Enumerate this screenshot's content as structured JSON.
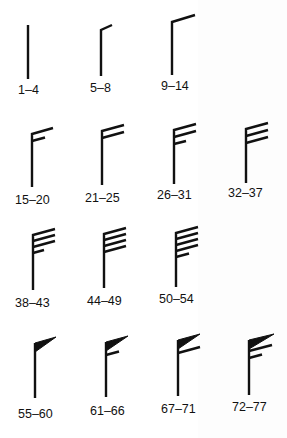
{
  "diagram": {
    "title_fragment": "",
    "units_note": "",
    "colors": {
      "ink": "#111111",
      "background": "#ffffff"
    },
    "barbs": [
      {
        "label": "1–4",
        "row": 1,
        "col": 1,
        "pennants": 0,
        "full_barbs": 0,
        "half_barbs": 0
      },
      {
        "label": "5–8",
        "row": 1,
        "col": 2,
        "pennants": 0,
        "full_barbs": 0,
        "half_barbs": 1
      },
      {
        "label": "9–14",
        "row": 1,
        "col": 3,
        "pennants": 0,
        "full_barbs": 1,
        "half_barbs": 0
      },
      {
        "label": "15–20",
        "row": 2,
        "col": 1,
        "pennants": 0,
        "full_barbs": 1,
        "half_barbs": 1
      },
      {
        "label": "21–25",
        "row": 2,
        "col": 2,
        "pennants": 0,
        "full_barbs": 2,
        "half_barbs": 0
      },
      {
        "label": "26–31",
        "row": 2,
        "col": 3,
        "pennants": 0,
        "full_barbs": 2,
        "half_barbs": 1
      },
      {
        "label": "32–37",
        "row": 2,
        "col": 4,
        "pennants": 0,
        "full_barbs": 3,
        "half_barbs": 0
      },
      {
        "label": "38–43",
        "row": 3,
        "col": 1,
        "pennants": 0,
        "full_barbs": 3,
        "half_barbs": 1
      },
      {
        "label": "44–49",
        "row": 3,
        "col": 2,
        "pennants": 0,
        "full_barbs": 4,
        "half_barbs": 0
      },
      {
        "label": "50–54",
        "row": 3,
        "col": 3,
        "pennants": 0,
        "full_barbs": 4,
        "half_barbs": 1
      },
      {
        "label": "55–60",
        "row": 4,
        "col": 1,
        "pennants": 1,
        "full_barbs": 0,
        "half_barbs": 0
      },
      {
        "label": "61–66",
        "row": 4,
        "col": 2,
        "pennants": 1,
        "full_barbs": 0,
        "half_barbs": 1
      },
      {
        "label": "67–71",
        "row": 4,
        "col": 3,
        "pennants": 1,
        "full_barbs": 1,
        "half_barbs": 0
      },
      {
        "label": "72–77",
        "row": 4,
        "col": 4,
        "pennants": 1,
        "full_barbs": 1,
        "half_barbs": 1
      }
    ]
  }
}
